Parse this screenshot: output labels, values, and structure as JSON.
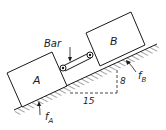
{
  "diagram": {
    "type": "incline-blocks",
    "labels": {
      "block_a": "A",
      "block_b": "B",
      "bar": "Bar",
      "friction_a": "f",
      "friction_a_sub": "A",
      "friction_b": "f",
      "friction_b_sub": "B",
      "run": "15",
      "rise": "8"
    },
    "slope": {
      "rise": 8,
      "run": 15
    },
    "colors": {
      "ink": "#1a1a1a",
      "background": "#ffffff"
    }
  }
}
